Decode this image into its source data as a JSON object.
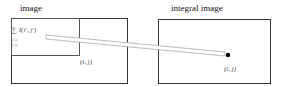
{
  "left_panel": {
    "title": "image",
    "formula": "∑ I(i′, j′)",
    "formula_sub_1": "i′≤i",
    "formula_sub_2": "j′≤j",
    "coord_label": "(i, j)"
  },
  "right_panel": {
    "title": "integral image",
    "coord_label": "(i, j)"
  },
  "colors": {
    "border": "#333333",
    "arrow_outline": "#aaaaaa",
    "point": "#000000"
  }
}
